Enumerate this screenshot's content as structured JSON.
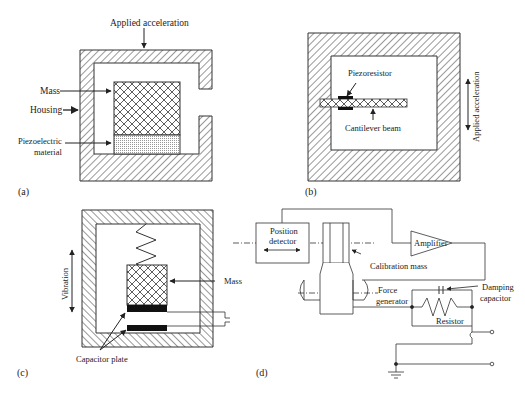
{
  "panels": {
    "a": {
      "tag": "(a)",
      "applied_acceleration": "Applied acceleration",
      "mass": "Mass",
      "housing": "Housing",
      "piezo_line1": "Piezoelectric",
      "piezo_line2": "material"
    },
    "b": {
      "tag": "(b)",
      "piezoresistor": "Piezoresistor",
      "cantilever_beam": "Cantilever beam",
      "applied_acceleration": "Applied acceleration"
    },
    "c": {
      "tag": "(c)",
      "vibration": "Vibration",
      "mass": "Mass",
      "capacitor_plate": "Capacitor plate"
    },
    "d": {
      "tag": "(d)",
      "position_line1": "Position",
      "position_line2": "detector",
      "amplifier": "Amplifier",
      "calibration_mass": "Calibration mass",
      "force_line1": "Force",
      "force_line2": "generator",
      "damping_line1": "Damping",
      "damping_line2": "capacitor",
      "resistor": "Resistor"
    }
  }
}
